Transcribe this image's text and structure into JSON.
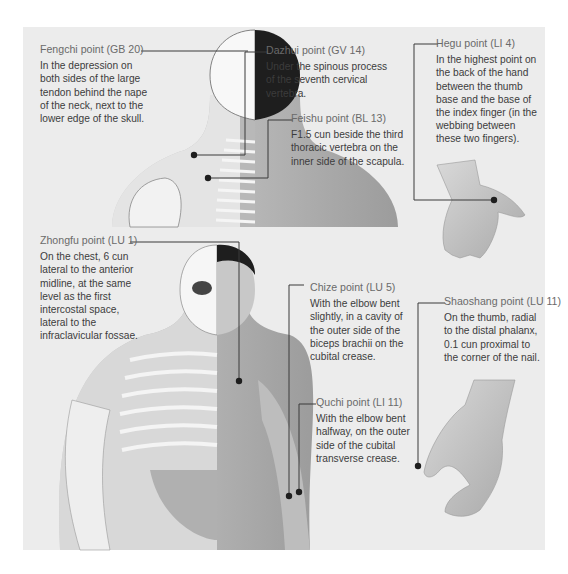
{
  "diagram": {
    "background_color": "#ececec",
    "text_color": "#3c3c3c",
    "title_color": "#6a6a6a",
    "figures": [
      {
        "name": "back-view-torso",
        "description": "Back of head, neck and shoulders, half skeleton"
      },
      {
        "name": "back-of-hand",
        "description": "Back of left hand"
      },
      {
        "name": "front-view-torso",
        "description": "Front of head and torso, half skeleton"
      },
      {
        "name": "hand-thumb-side",
        "description": "Hand viewed from thumb side"
      }
    ],
    "points": [
      {
        "title": "Fengchi point (GB 20)",
        "description": "In the depression on both sides of the large tendon behind the nape of the neck, next to the lower edge of the skull."
      },
      {
        "title": "Dazhui point (GV 14)",
        "description": "Under the spinous process of the seventh cervical vertebra."
      },
      {
        "title": "Feishu point (BL 13)",
        "description": "F1.5 cun beside the third thoracic vertebra on the inner side of the scapula."
      },
      {
        "title": "Hegu point (LI 4)",
        "description": "In the highest point on the back of the hand between the thumb base and the base of the index finger (in the webbing between these two fingers)."
      },
      {
        "title": "Zhongfu point (LU 1)",
        "description": "On the chest, 6 cun lateral to the anterior midline, at the same level as the first intercostal space, lateral to the infraclavicular fossae."
      },
      {
        "title": "Chize point (LU 5)",
        "description": "With the elbow bent slightly, in a cavity of the outer side of the biceps brachii on the cubital crease."
      },
      {
        "title": "Quchi point (LI 11)",
        "description": "With the elbow bent halfway, on the outer side of the cubital transverse crease."
      },
      {
        "title": "Shaoshang point (LU 11)",
        "description": "On the thumb, radial to the distal phalanx, 0.1 cun proximal to the corner of the nail."
      }
    ]
  }
}
